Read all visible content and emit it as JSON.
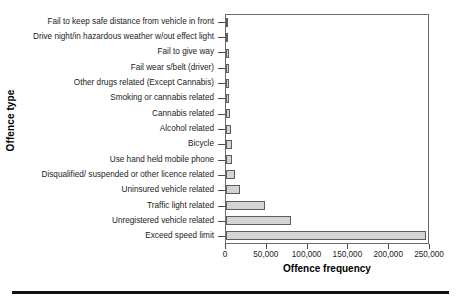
{
  "chart_data": {
    "type": "bar",
    "orientation": "horizontal",
    "title": "",
    "xlabel": "Offence frequency",
    "ylabel": "Offence type",
    "xlim": [
      0,
      250000
    ],
    "xticks": [
      0,
      50000,
      100000,
      150000,
      200000,
      250000
    ],
    "xticklabels": [
      "0",
      "50,000",
      "100,000",
      "150,000",
      "200,000",
      "250,000"
    ],
    "grid": false,
    "legend": false,
    "bar_fill_color": "#d4d4d4",
    "bar_edge_color": "#5d5d5d",
    "categories": [
      "Fail to keep safe distance from vehicle in front",
      "Drive night/in hazardous weather w/out effect light",
      "Fail to give way",
      "Fail wear s/belt (driver)",
      "Other drugs related (Except Cannabis)",
      "Smoking or cannabis related",
      "Cannabis related",
      "Alcohol related",
      "Bicycle",
      "Use hand held mobile phone",
      "Disqualified/ suspended or other licence related",
      "Uninsured vehicle related",
      "Traffic light related",
      "Unregistered vehicle related",
      "Exceed speed limit"
    ],
    "values": [
      2500,
      2800,
      3200,
      3600,
      3800,
      4200,
      5500,
      6500,
      7000,
      8000,
      11000,
      17000,
      48000,
      80000,
      248000
    ]
  }
}
